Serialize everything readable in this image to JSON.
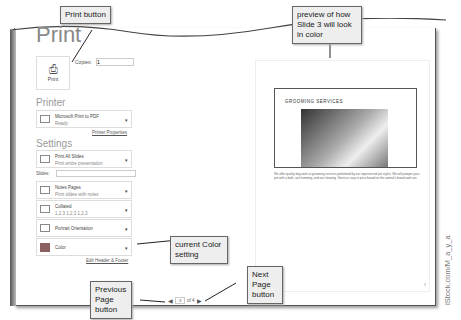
{
  "title": "Print",
  "print_button": {
    "label": "Print"
  },
  "copies": {
    "label": "Copies:",
    "value": "1"
  },
  "printer": {
    "section": "Printer",
    "name": "Microsoft Print to PDF",
    "status": "Ready",
    "properties_link": "Printer Properties"
  },
  "settings": {
    "section": "Settings",
    "options": [
      {
        "line1": "Print All Slides",
        "line2": "Print entire presentation"
      },
      {
        "line1": "Notes Pages",
        "line2": "Print slides with notes"
      },
      {
        "line1": "Collated",
        "line2": "1,2,3   1,2,3   1,2,3"
      },
      {
        "line1": "Portrait Orientation",
        "line2": ""
      },
      {
        "line1": "Color",
        "line2": ""
      }
    ],
    "slides_label": "Slides:",
    "header_footer_link": "Edit Header & Footer"
  },
  "preview": {
    "slide_title": "GROOMING SERVICES",
    "body": "We offer quality dog and cat grooming services performed by our experienced pet stylist. We will pamper your pet with a bath, nail trimming, and ear cleaning. Services vary in price based on the animal's breed and size.",
    "page_number": "3"
  },
  "nav": {
    "current_page": "3",
    "of_label": "of 4"
  },
  "callouts": {
    "print": "Print button",
    "preview": "preview of how Slide 3 will look in color",
    "color": "current Color setting",
    "prev": "Previous Page button",
    "next": "Next Page button"
  },
  "credit": "iStock.com/M_a_y_a"
}
